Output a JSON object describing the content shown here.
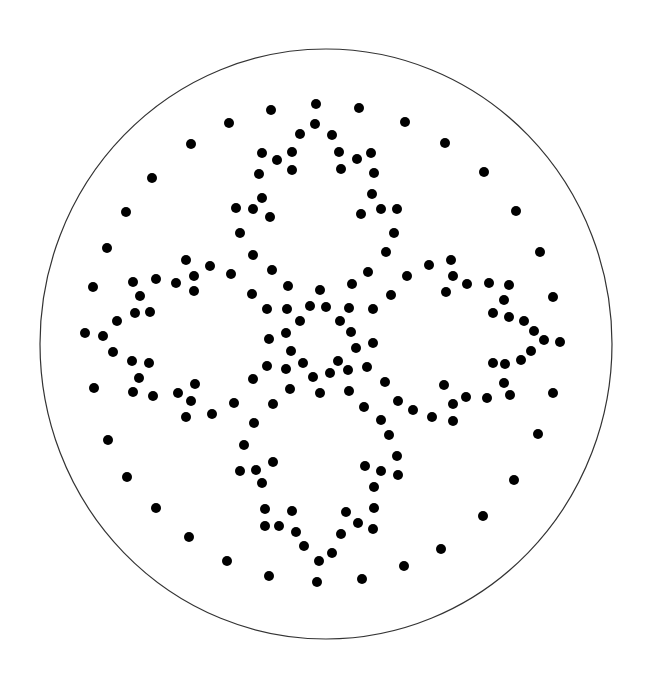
{
  "figure": {
    "background": "#ffffff",
    "outline": {
      "shape": "ellipse",
      "cx": 326,
      "cy": 344,
      "rx": 286,
      "ry": 295,
      "stroke": "#333333",
      "stroke_width": 1.2
    },
    "dot_style": {
      "radius": 5,
      "fill": "#000000"
    },
    "dots": [
      [
        229,
        123
      ],
      [
        271,
        110
      ],
      [
        316,
        104
      ],
      [
        359,
        108
      ],
      [
        405,
        122
      ],
      [
        315,
        124
      ],
      [
        300,
        134
      ],
      [
        332,
        135
      ],
      [
        262,
        153
      ],
      [
        277,
        160
      ],
      [
        292,
        152
      ],
      [
        292,
        170
      ],
      [
        259,
        174
      ],
      [
        339,
        152
      ],
      [
        357,
        159
      ],
      [
        371,
        153
      ],
      [
        341,
        169
      ],
      [
        374,
        173
      ],
      [
        262,
        198
      ],
      [
        236,
        208
      ],
      [
        253,
        209
      ],
      [
        270,
        217
      ],
      [
        240,
        233
      ],
      [
        372,
        194
      ],
      [
        381,
        209
      ],
      [
        397,
        209
      ],
      [
        361,
        214
      ],
      [
        394,
        233
      ],
      [
        191,
        144
      ],
      [
        152,
        178
      ],
      [
        126,
        212
      ],
      [
        107,
        248
      ],
      [
        253,
        255
      ],
      [
        186,
        260
      ],
      [
        210,
        266
      ],
      [
        231,
        274
      ],
      [
        194,
        276
      ],
      [
        156,
        279
      ],
      [
        133,
        282
      ],
      [
        176,
        283
      ],
      [
        93,
        287
      ],
      [
        194,
        291
      ],
      [
        140,
        296
      ],
      [
        252,
        294
      ],
      [
        135,
        313
      ],
      [
        150,
        312
      ],
      [
        117,
        321
      ],
      [
        85,
        333
      ],
      [
        103,
        336
      ],
      [
        267,
        309
      ],
      [
        269,
        339
      ],
      [
        113,
        352
      ],
      [
        132,
        361
      ],
      [
        149,
        363
      ],
      [
        267,
        366
      ],
      [
        139,
        378
      ],
      [
        253,
        379
      ],
      [
        94,
        388
      ],
      [
        133,
        392
      ],
      [
        153,
        396
      ],
      [
        178,
        393
      ],
      [
        195,
        384
      ],
      [
        191,
        401
      ],
      [
        234,
        403
      ],
      [
        186,
        417
      ],
      [
        212,
        414
      ],
      [
        254,
        423
      ],
      [
        386,
        252
      ],
      [
        272,
        270
      ],
      [
        368,
        272
      ],
      [
        407,
        276
      ],
      [
        288,
        286
      ],
      [
        320,
        290
      ],
      [
        352,
        284
      ],
      [
        391,
        295
      ],
      [
        287,
        309
      ],
      [
        310,
        306
      ],
      [
        326,
        307
      ],
      [
        349,
        308
      ],
      [
        373,
        309
      ],
      [
        300,
        321
      ],
      [
        340,
        321
      ],
      [
        286,
        333
      ],
      [
        351,
        332
      ],
      [
        373,
        343
      ],
      [
        291,
        351
      ],
      [
        356,
        348
      ],
      [
        286,
        369
      ],
      [
        303,
        363
      ],
      [
        338,
        361
      ],
      [
        348,
        370
      ],
      [
        367,
        367
      ],
      [
        313,
        377
      ],
      [
        330,
        373
      ],
      [
        385,
        382
      ],
      [
        290,
        389
      ],
      [
        320,
        393
      ],
      [
        349,
        391
      ],
      [
        273,
        404
      ],
      [
        398,
        401
      ],
      [
        364,
        407
      ],
      [
        413,
        410
      ],
      [
        540,
        252
      ],
      [
        429,
        265
      ],
      [
        451,
        260
      ],
      [
        453,
        276
      ],
      [
        467,
        284
      ],
      [
        489,
        283
      ],
      [
        509,
        285
      ],
      [
        446,
        292
      ],
      [
        504,
        300
      ],
      [
        553,
        297
      ],
      [
        493,
        313
      ],
      [
        509,
        317
      ],
      [
        524,
        321
      ],
      [
        534,
        331
      ],
      [
        544,
        340
      ],
      [
        560,
        342
      ],
      [
        531,
        351
      ],
      [
        521,
        360
      ],
      [
        493,
        363
      ],
      [
        505,
        364
      ],
      [
        444,
        385
      ],
      [
        504,
        383
      ],
      [
        510,
        395
      ],
      [
        466,
        397
      ],
      [
        487,
        398
      ],
      [
        553,
        393
      ],
      [
        453,
        404
      ],
      [
        432,
        417
      ],
      [
        453,
        421
      ],
      [
        381,
        420
      ],
      [
        389,
        435
      ],
      [
        244,
        445
      ],
      [
        273,
        462
      ],
      [
        397,
        456
      ],
      [
        240,
        471
      ],
      [
        256,
        470
      ],
      [
        365,
        466
      ],
      [
        381,
        471
      ],
      [
        398,
        475
      ],
      [
        262,
        483
      ],
      [
        374,
        487
      ],
      [
        265,
        509
      ],
      [
        292,
        511
      ],
      [
        374,
        508
      ],
      [
        346,
        512
      ],
      [
        265,
        526
      ],
      [
        279,
        526
      ],
      [
        296,
        532
      ],
      [
        358,
        523
      ],
      [
        373,
        529
      ],
      [
        341,
        534
      ],
      [
        304,
        546
      ],
      [
        332,
        553
      ],
      [
        319,
        561
      ],
      [
        227,
        561
      ],
      [
        404,
        566
      ],
      [
        269,
        576
      ],
      [
        317,
        582
      ],
      [
        362,
        579
      ],
      [
        108,
        440
      ],
      [
        127,
        477
      ],
      [
        156,
        508
      ],
      [
        189,
        537
      ],
      [
        538,
        434
      ],
      [
        514,
        480
      ],
      [
        483,
        516
      ],
      [
        441,
        549
      ],
      [
        445,
        143
      ],
      [
        484,
        172
      ],
      [
        516,
        211
      ]
    ]
  }
}
